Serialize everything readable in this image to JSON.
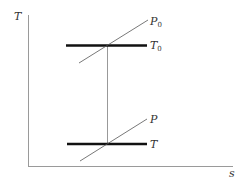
{
  "diagram": {
    "type": "T-s diagram",
    "axes": {
      "y_label": "T",
      "x_label": "s"
    },
    "lines": {
      "stagnation_temperature": {
        "label": "T",
        "subscript": "0"
      },
      "stagnation_pressure": {
        "label": "P",
        "subscript": "0"
      },
      "static_temperature": {
        "label": "T",
        "subscript": ""
      },
      "static_pressure": {
        "label": "P",
        "subscript": ""
      }
    },
    "colors": {
      "axis": "#9a9a9a",
      "thick_line": "#111111",
      "thin_line": "#555555",
      "vertical_line": "#999999",
      "text": "#333333"
    }
  }
}
